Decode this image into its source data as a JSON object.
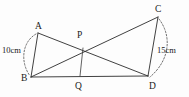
{
  "figure": {
    "type": "geometry-diagram",
    "background_color": "#fdfdfd",
    "stroke_color": "#2b2b2b",
    "vertices": [
      {
        "name": "A",
        "label": "A",
        "x": 38,
        "y": 33,
        "label_x": 35,
        "label_y": 29
      },
      {
        "name": "B",
        "label": "B",
        "x": 31,
        "y": 77,
        "label_x": 21,
        "label_y": 81
      },
      {
        "name": "C",
        "label": "C",
        "x": 158,
        "y": 17,
        "label_x": 155,
        "label_y": 12
      },
      {
        "name": "D",
        "label": "D",
        "x": 148,
        "y": 76,
        "label_x": 149,
        "label_y": 89
      },
      {
        "name": "P",
        "label": "P",
        "x": 83,
        "y": 48,
        "label_x": 77,
        "label_y": 38
      },
      {
        "name": "Q",
        "label": "Q",
        "x": 80,
        "y": 76,
        "label_x": 75,
        "label_y": 89
      }
    ],
    "segments": [
      {
        "name": "segment-AB",
        "from": "A",
        "to": "B"
      },
      {
        "name": "segment-AD",
        "from": "A",
        "to": "D"
      },
      {
        "name": "segment-BC",
        "from": "B",
        "to": "C"
      },
      {
        "name": "segment-BD",
        "from": "B",
        "to": "D"
      },
      {
        "name": "segment-CD",
        "from": "C",
        "to": "D"
      },
      {
        "name": "segment-PQ",
        "from": "P",
        "to": "Q"
      }
    ],
    "arcs": [
      {
        "name": "arc-AB",
        "path": "M 36 34 C 22 42, 20 62, 30 76",
        "measure_label": "10cm",
        "label_x": 2,
        "label_y": 53
      },
      {
        "name": "arc-CD",
        "path": "M 159 19 C 172 36, 170 60, 150 77",
        "measure_label": "15cm",
        "label_x": 157,
        "label_y": 53
      }
    ],
    "measures": {
      "left_side": "10cm",
      "right_side": "15cm"
    }
  }
}
